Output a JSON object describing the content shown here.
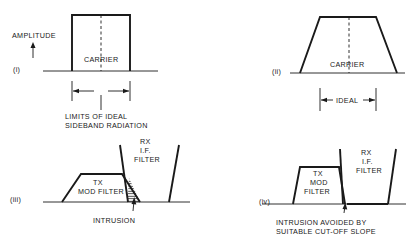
{
  "diagram": {
    "panels": [
      {
        "id": "i",
        "label": "(i)",
        "axis_label": "AMPLITUDE",
        "center_label": "CARRIER",
        "dimension_label_line1": "LIMITS OF IDEAL",
        "dimension_label_line2": "SIDEBAND RADIATION"
      },
      {
        "id": "ii",
        "label": "(ii)",
        "center_label": "CARRIER",
        "dimension_label": "IDEAL"
      },
      {
        "id": "iii",
        "label": "(iii)",
        "tx_filter_line1": "TX",
        "tx_filter_line2": "MOD FILTER",
        "rx_filter_line1": "RX",
        "rx_filter_line2": "I.F.",
        "rx_filter_line3": "FILTER",
        "annotation": "INTRUSION"
      },
      {
        "id": "iv",
        "label": "(iv)",
        "tx_filter_line1": "TX",
        "tx_filter_line2": "MOD",
        "tx_filter_line3": "FILTER",
        "rx_filter_line1": "RX",
        "rx_filter_line2": "I.F.",
        "rx_filter_line3": "FILTER",
        "annotation_line1": "INTRUSION AVOIDED BY",
        "annotation_line2": "SUITABLE CUT-OFF SLOPE"
      }
    ],
    "colors": {
      "ink": "#1a1a1a",
      "background": "#ffffff"
    }
  }
}
